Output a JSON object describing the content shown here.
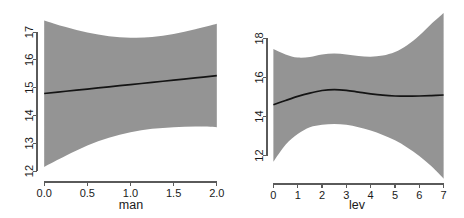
{
  "figure": {
    "background": "#ffffff",
    "band_color": "#949494",
    "line_color": "#141414",
    "axis_color": "#5a5a5a"
  },
  "chart_data": [
    {
      "type": "line",
      "title": "",
      "xlabel": "man",
      "ylabel": "",
      "xlim": [
        -0.06,
        2.06
      ],
      "ylim": [
        11.75,
        17.65
      ],
      "xticks": [
        0,
        0.5,
        1,
        1.5,
        2
      ],
      "xticklabels": [
        "0.0",
        "0.5",
        "1.0",
        "1.5",
        "2.0"
      ],
      "yticks": [
        12,
        13,
        14,
        15,
        16,
        17
      ],
      "yticklabels": [
        "12",
        "13",
        "14",
        "15",
        "16",
        "17"
      ],
      "grid": false,
      "legend": "none",
      "series": [
        {
          "name": "fit",
          "x": [
            0.0,
            0.25,
            0.5,
            0.75,
            1.0,
            1.25,
            1.5,
            1.75,
            2.0
          ],
          "values": [
            14.79,
            14.87,
            14.95,
            15.03,
            15.11,
            15.19,
            15.27,
            15.35,
            15.43
          ]
        },
        {
          "name": "confidence-band-upper",
          "x": [
            0.0,
            0.25,
            0.5,
            0.75,
            1.0,
            1.25,
            1.5,
            1.75,
            2.0
          ],
          "values": [
            17.42,
            17.18,
            16.98,
            16.85,
            16.8,
            16.82,
            16.93,
            17.1,
            17.3
          ]
        },
        {
          "name": "confidence-band-lower",
          "x": [
            0.0,
            0.25,
            0.5,
            0.75,
            1.0,
            1.25,
            1.5,
            1.75,
            2.0
          ],
          "values": [
            12.15,
            12.55,
            12.92,
            13.2,
            13.4,
            13.52,
            13.58,
            13.6,
            13.58
          ]
        }
      ]
    },
    {
      "type": "line",
      "title": "",
      "xlabel": "lev",
      "ylabel": "",
      "xlim": [
        -0.18,
        7.18
      ],
      "ylim": [
        10.75,
        19.35
      ],
      "xticks": [
        0,
        1,
        2,
        3,
        4,
        5,
        6,
        7
      ],
      "xticklabels": [
        "0",
        "1",
        "2",
        "3",
        "4",
        "5",
        "6",
        "7"
      ],
      "yticks": [
        12,
        14,
        16,
        18
      ],
      "yticklabels": [
        "12",
        "14",
        "16",
        "18"
      ],
      "grid": false,
      "legend": "none",
      "series": [
        {
          "name": "fit",
          "x": [
            0,
            0.5,
            1,
            1.5,
            2,
            2.5,
            3,
            3.5,
            4,
            4.5,
            5,
            5.5,
            6,
            6.5,
            7
          ],
          "values": [
            14.6,
            14.82,
            15.03,
            15.2,
            15.33,
            15.38,
            15.34,
            15.25,
            15.16,
            15.09,
            15.05,
            15.04,
            15.05,
            15.07,
            15.1
          ]
        },
        {
          "name": "confidence-band-upper",
          "x": [
            0,
            0.5,
            1,
            1.5,
            2,
            2.5,
            3,
            3.5,
            4,
            4.5,
            5,
            5.5,
            6,
            6.5,
            7
          ],
          "values": [
            17.45,
            17.18,
            17.02,
            17.05,
            17.18,
            17.22,
            17.18,
            17.1,
            17.06,
            17.12,
            17.3,
            17.65,
            18.15,
            18.75,
            19.3
          ]
        },
        {
          "name": "confidence-band-lower",
          "x": [
            0,
            0.5,
            1,
            1.5,
            2,
            2.5,
            3,
            3.5,
            4,
            4.5,
            5,
            5.5,
            6,
            6.5,
            7
          ],
          "values": [
            11.68,
            12.55,
            13.1,
            13.45,
            13.58,
            13.62,
            13.58,
            13.45,
            13.28,
            13.05,
            12.78,
            12.42,
            11.98,
            11.45,
            10.82
          ]
        }
      ]
    }
  ]
}
